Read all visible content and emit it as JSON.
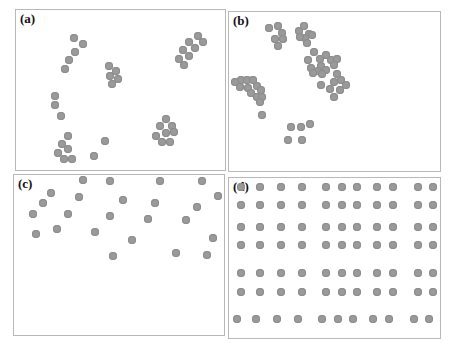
{
  "figure": {
    "panels": [
      {
        "id": "a",
        "label": "(a)",
        "description": "clustered points, small irregular groups",
        "box": {
          "left": 15,
          "top": 9,
          "width": 211,
          "height": 162
        },
        "points": [
          [
            74,
            38
          ],
          [
            83,
            44
          ],
          [
            75,
            52
          ],
          [
            69,
            60
          ],
          [
            65,
            69
          ],
          [
            109,
            66
          ],
          [
            116,
            71
          ],
          [
            110,
            76
          ],
          [
            118,
            79
          ],
          [
            112,
            84
          ],
          [
            55,
            96
          ],
          [
            55,
            105
          ],
          [
            61,
            116
          ],
          [
            68,
            136
          ],
          [
            62,
            144
          ],
          [
            68,
            149
          ],
          [
            58,
            153
          ],
          [
            64,
            159
          ],
          [
            72,
            159
          ],
          [
            105,
            141
          ],
          [
            94,
            156
          ],
          [
            198,
            36
          ],
          [
            203,
            42
          ],
          [
            189,
            42
          ],
          [
            195,
            48
          ],
          [
            183,
            50
          ],
          [
            189,
            56
          ],
          [
            179,
            59
          ],
          [
            184,
            65
          ],
          [
            166,
            119
          ],
          [
            160,
            126
          ],
          [
            172,
            126
          ],
          [
            166,
            133
          ],
          [
            174,
            132
          ],
          [
            156,
            136
          ],
          [
            162,
            142
          ],
          [
            170,
            142
          ]
        ]
      },
      {
        "id": "b",
        "label": "(b)",
        "description": "clustered points, dense aggregated groups",
        "box": {
          "left": 228,
          "top": 11,
          "width": 213,
          "height": 161
        },
        "points": [
          [
            269,
            28
          ],
          [
            278,
            26
          ],
          [
            282,
            33
          ],
          [
            275,
            39
          ],
          [
            283,
            39
          ],
          [
            278,
            46
          ],
          [
            299,
            31
          ],
          [
            304,
            26
          ],
          [
            309,
            34
          ],
          [
            305,
            38
          ],
          [
            312,
            35
          ],
          [
            307,
            43
          ],
          [
            300,
            37
          ],
          [
            314,
            52
          ],
          [
            320,
            59
          ],
          [
            326,
            55
          ],
          [
            308,
            60
          ],
          [
            321,
            66
          ],
          [
            331,
            60
          ],
          [
            311,
            68
          ],
          [
            318,
            71
          ],
          [
            326,
            70
          ],
          [
            334,
            65
          ],
          [
            313,
            73
          ],
          [
            322,
            74
          ],
          [
            337,
            59
          ],
          [
            337,
            74
          ],
          [
            334,
            82
          ],
          [
            341,
            80
          ],
          [
            330,
            89
          ],
          [
            340,
            90
          ],
          [
            346,
            85
          ],
          [
            334,
            97
          ],
          [
            321,
            85
          ],
          [
            241,
            80
          ],
          [
            235,
            82
          ],
          [
            240,
            87
          ],
          [
            247,
            80
          ],
          [
            253,
            80
          ],
          [
            248,
            88
          ],
          [
            257,
            86
          ],
          [
            261,
            90
          ],
          [
            251,
            93
          ],
          [
            257,
            97
          ],
          [
            262,
            97
          ],
          [
            260,
            102
          ],
          [
            262,
            115
          ],
          [
            291,
            127
          ],
          [
            301,
            127
          ],
          [
            310,
            124
          ],
          [
            288,
            140
          ],
          [
            302,
            140
          ]
        ]
      },
      {
        "id": "c",
        "label": "(c)",
        "description": "random scattered points in upper half",
        "box": {
          "left": 13,
          "top": 174,
          "width": 212,
          "height": 162
        },
        "points": [
          [
            83,
            180
          ],
          [
            110,
            181
          ],
          [
            160,
            181
          ],
          [
            202,
            181
          ],
          [
            51,
            193
          ],
          [
            79,
            197
          ],
          [
            123,
            200
          ],
          [
            155,
            203
          ],
          [
            218,
            196
          ],
          [
            43,
            203
          ],
          [
            68,
            214
          ],
          [
            110,
            216
          ],
          [
            148,
            219
          ],
          [
            186,
            220
          ],
          [
            197,
            207
          ],
          [
            33,
            214
          ],
          [
            95,
            232
          ],
          [
            132,
            240
          ],
          [
            213,
            238
          ],
          [
            36,
            234
          ],
          [
            57,
            229
          ],
          [
            113,
            256
          ],
          [
            176,
            253
          ],
          [
            207,
            255
          ]
        ]
      },
      {
        "id": "d",
        "label": "(d)",
        "description": "regular grid of points",
        "box": {
          "left": 228,
          "top": 177,
          "width": 213,
          "height": 162
        },
        "rows_y": [
          187,
          205,
          227,
          245,
          273,
          292,
          319
        ],
        "cols_x": [
          241,
          260,
          281,
          302,
          326,
          342,
          357,
          377,
          393,
          418,
          433
        ],
        "row_offsets": [
          0,
          0,
          0,
          0,
          0,
          0,
          -4
        ]
      }
    ],
    "dot_color": "#9a9a9a",
    "border_color": "#b8b8b8"
  }
}
